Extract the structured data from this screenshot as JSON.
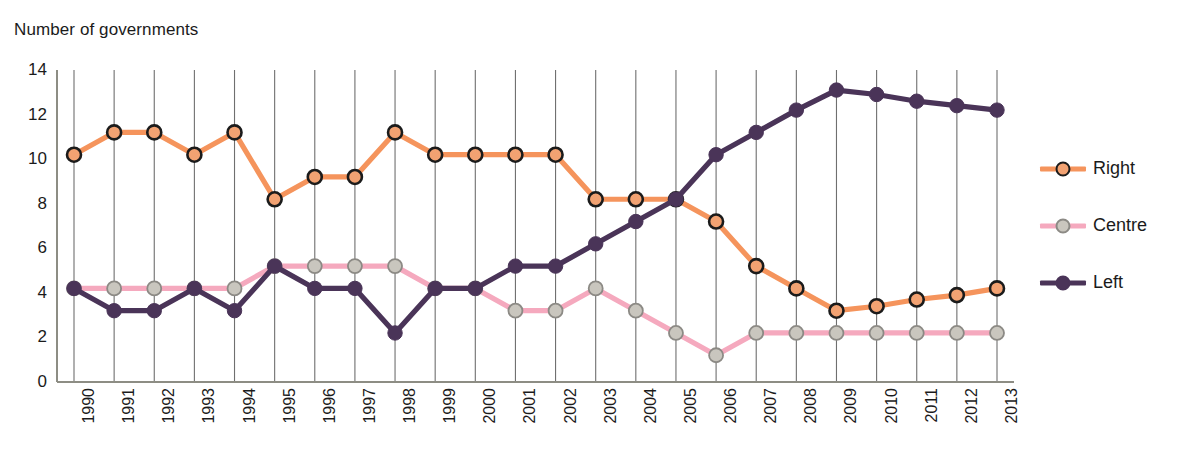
{
  "chart_data": {
    "type": "line",
    "title": "Number of governments",
    "xlabel": "",
    "ylabel": "Number of governments",
    "ylim": [
      0,
      14
    ],
    "yticks": [
      0,
      2,
      4,
      6,
      8,
      10,
      12,
      14
    ],
    "grid": "vertical",
    "legend_position": "right",
    "categories": [
      "1990",
      "1991",
      "1992",
      "1993",
      "1994",
      "1995",
      "1996",
      "1997",
      "1998",
      "1999",
      "2000",
      "2001",
      "2002",
      "2003",
      "2004",
      "2005",
      "2006",
      "2007",
      "2008",
      "2009",
      "2010",
      "2011",
      "2012",
      "2013"
    ],
    "series": [
      {
        "name": "Right",
        "color": "#F5945C",
        "marker_fill": "#F2A272",
        "marker_stroke": "#1b1b1b",
        "values": [
          10.2,
          11.2,
          11.2,
          10.2,
          11.2,
          8.2,
          9.2,
          9.2,
          11.2,
          10.2,
          10.2,
          10.2,
          10.2,
          8.2,
          8.2,
          8.2,
          7.2,
          5.2,
          4.2,
          3.2,
          3.4,
          3.7,
          3.9,
          4.2
        ]
      },
      {
        "name": "Centre",
        "color": "#F5A9BE",
        "marker_fill": "#C9C6BE",
        "marker_stroke": "#8C8A85",
        "values": [
          4.2,
          4.2,
          4.2,
          4.2,
          4.2,
          5.2,
          5.2,
          5.2,
          5.2,
          4.2,
          4.2,
          3.2,
          3.2,
          4.2,
          3.2,
          2.2,
          1.2,
          2.2,
          2.2,
          2.2,
          2.2,
          2.2,
          2.2,
          2.2
        ]
      },
      {
        "name": "Left",
        "color": "#4A3458",
        "marker_fill": "#4A3458",
        "marker_stroke": "#4A3458",
        "values": [
          4.2,
          3.2,
          3.2,
          4.2,
          3.2,
          5.2,
          4.2,
          4.2,
          2.2,
          4.2,
          4.2,
          5.2,
          5.2,
          6.2,
          7.2,
          8.2,
          10.2,
          11.2,
          12.2,
          13.1,
          12.9,
          12.6,
          12.4,
          12.2
        ]
      }
    ]
  },
  "legend": {
    "items": [
      {
        "label": "Right"
      },
      {
        "label": "Centre"
      },
      {
        "label": "Left"
      }
    ]
  },
  "colors": {
    "gridline": "#6f6f6f",
    "axis": "#8d8d84",
    "text": "#1b1b1b",
    "right": "#F5945C",
    "centre": "#F5A9BE",
    "left": "#4A3458"
  }
}
